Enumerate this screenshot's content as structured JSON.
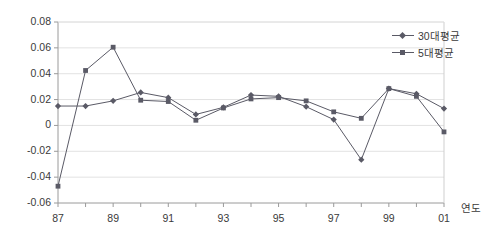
{
  "chart_data": {
    "type": "line",
    "title": "",
    "xlabel": "연도",
    "ylabel": "",
    "x": [
      "87",
      "88",
      "89",
      "90",
      "91",
      "92",
      "93",
      "94",
      "95",
      "96",
      "97",
      "98",
      "99",
      "00",
      "01"
    ],
    "tick_labels_x": [
      "87",
      "",
      "89",
      "",
      "91",
      "",
      "93",
      "",
      "95",
      "",
      "97",
      "",
      "99",
      "",
      "01"
    ],
    "tick_labels_y": [
      "0.08",
      "0.06",
      "0.04",
      "0.02",
      "0",
      "-0.02",
      "-0.04",
      "-0.06"
    ],
    "ylim": [
      -0.06,
      0.08
    ],
    "ytick_step": 0.02,
    "grid": true,
    "legend_position": "top-right",
    "series": [
      {
        "name": "30대평균",
        "marker": "diamond",
        "color": "#5a5a66",
        "values": [
          0.015,
          0.015,
          0.019,
          0.0255,
          0.0215,
          0.0085,
          0.014,
          0.0235,
          0.0225,
          0.0145,
          0.0045,
          -0.0265,
          0.0285,
          0.0245,
          0.013
        ]
      },
      {
        "name": "5대평균",
        "marker": "square",
        "color": "#5a5a66",
        "values": [
          -0.047,
          0.0425,
          0.0605,
          0.0195,
          0.0185,
          0.004,
          0.0135,
          0.0205,
          0.0215,
          0.019,
          0.0105,
          0.0055,
          0.0285,
          0.0225,
          -0.005
        ]
      }
    ]
  },
  "legend": {
    "items": [
      {
        "label": "30대평균"
      },
      {
        "label": "5대평균"
      }
    ]
  },
  "axis": {
    "x_title": "연도"
  }
}
